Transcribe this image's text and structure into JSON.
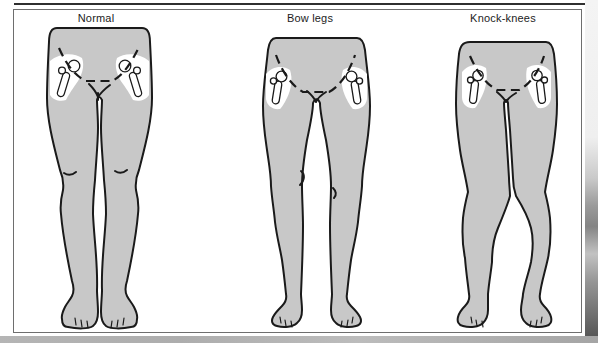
{
  "figure": {
    "panels": [
      {
        "id": "normal",
        "label": "Normal"
      },
      {
        "id": "bow-legs",
        "label": "Bow legs"
      },
      {
        "id": "knock-knees",
        "label": "Knock-knees"
      }
    ]
  },
  "colors": {
    "figure_fill": "#c8c8c8",
    "outline": "#1a1a1a",
    "bone_fill": "#ffffff",
    "frame_border": "#6e6e6e",
    "top_rule": "#2f2f2f",
    "label_text": "#1c1c1c",
    "bottom_strip": "#b5b5b5"
  }
}
